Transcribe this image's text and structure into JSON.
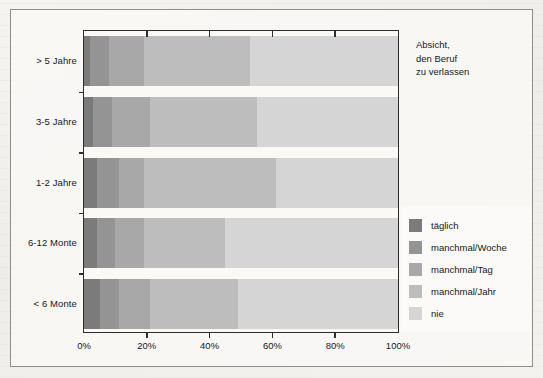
{
  "annotation": {
    "line1": "Absicht,",
    "line2": "den Beruf",
    "line3": "zu verlassen"
  },
  "legend": {
    "items": [
      {
        "label": "täglich",
        "color": "#7b7b7b"
      },
      {
        "label": "manchmal/Woche",
        "color": "#949494"
      },
      {
        "label": "manchmal/Tag",
        "color": "#a8a8a8"
      },
      {
        "label": "manchmal/Jahr",
        "color": "#bdbdbd"
      },
      {
        "label": "nie",
        "color": "#d5d5d5"
      }
    ]
  },
  "chart_data": {
    "type": "bar",
    "orientation": "horizontal",
    "stacked": true,
    "normalized": true,
    "title": "",
    "xlabel": "",
    "ylabel": "",
    "xlim": [
      0,
      100
    ],
    "grid": false,
    "legend_position": "right",
    "annotation": "Absicht, den Beruf zu verlassen",
    "categories": [
      "> 5 Jahre",
      "3-5 Jahre",
      "1-2 Jahre",
      "6-12 Monte",
      "< 6 Monte"
    ],
    "xticks": [
      0,
      20,
      40,
      60,
      80,
      100
    ],
    "xticklabels": [
      "0%",
      "20%",
      "40%",
      "60%",
      "80%",
      "100%"
    ],
    "series": [
      {
        "name": "täglich",
        "color": "#7b7b7b",
        "values": [
          2,
          3,
          4,
          4,
          5
        ]
      },
      {
        "name": "manchmal/Woche",
        "color": "#949494",
        "values": [
          6,
          6,
          7,
          6,
          6
        ]
      },
      {
        "name": "manchmal/Tag",
        "color": "#a8a8a8",
        "values": [
          11,
          12,
          8,
          9,
          10
        ]
      },
      {
        "name": "manchmal/Jahr",
        "color": "#bdbdbd",
        "values": [
          34,
          34,
          42,
          26,
          28
        ]
      },
      {
        "name": "nie",
        "color": "#d5d5d5",
        "values": [
          47,
          45,
          39,
          55,
          51
        ]
      }
    ]
  }
}
